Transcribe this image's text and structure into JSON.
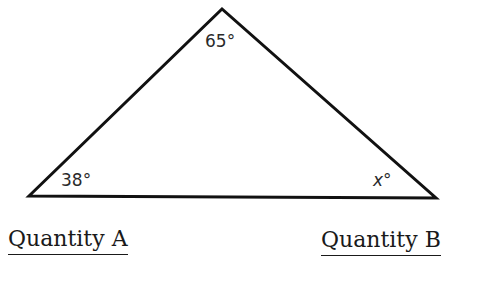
{
  "figure": {
    "type": "triangle",
    "vertices": {
      "left": [
        29,
        196
      ],
      "top": [
        222,
        9
      ],
      "right": [
        436,
        198
      ]
    },
    "angles": {
      "top": "65°",
      "left": "38°",
      "right": "x°"
    },
    "stroke_color": "#111111"
  },
  "quantities": {
    "a_label": "Quantity A",
    "b_label": "Quantity B"
  }
}
